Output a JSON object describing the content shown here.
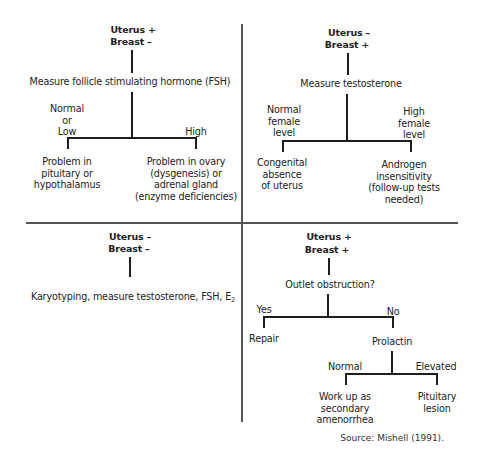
{
  "diagram": {
    "type": "decision-flowchart",
    "layout": "2x2 quadrants",
    "quadrants": [
      {
        "id": "top-left",
        "condition": [
          "Uterus +",
          "Breast –"
        ],
        "test": "Measure follicle stimulating hormone (FSH)",
        "branches": [
          {
            "label": "Normal\nor\nLow",
            "outcome": "Problem in\npituitary or\nhypothalamus"
          },
          {
            "label": "High",
            "outcome": "Problem in ovary\n(dysgenesis) or\nadrenal gland\n(enzyme deficiencies)"
          }
        ]
      },
      {
        "id": "top-right",
        "condition": [
          "Uterus –",
          "Breast +"
        ],
        "test": "Measure testosterone",
        "branches": [
          {
            "label": "Normal\nfemale\nlevel",
            "outcome": "Congenital\nabsence\nof uterus"
          },
          {
            "label": "High\nfemale\nlevel",
            "outcome": "Androgen insensitivity\n(follow-up tests needed)"
          }
        ]
      },
      {
        "id": "bottom-left",
        "condition": [
          "Uterus –",
          "Breast –"
        ],
        "test": "Karyotyping, measure testosterone, FSH, E",
        "test_subscript": "2"
      },
      {
        "id": "bottom-right",
        "condition": [
          "Uterus +",
          "Breast +"
        ],
        "test": "Outlet obstruction?",
        "branches": [
          {
            "label": "Yes",
            "outcome": "Repair"
          },
          {
            "label": "No",
            "outcome": "Prolactin",
            "branches": [
              {
                "label": "Normal",
                "outcome": "Work up as\nsecondary\namenorrhea"
              },
              {
                "label": "Elevated",
                "outcome": "Pituitary\nlesion"
              }
            ]
          }
        ]
      }
    ],
    "source": "Source: Mishell (1991)."
  }
}
